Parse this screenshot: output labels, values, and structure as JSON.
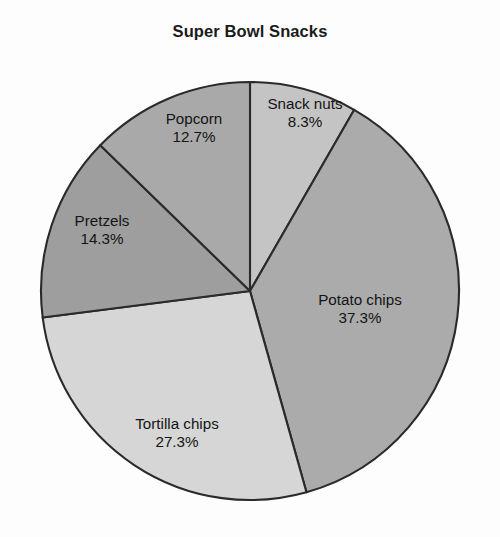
{
  "chart_data": {
    "type": "pie",
    "title": "Super Bowl Snacks",
    "xlabel": "",
    "ylabel": "",
    "legend": "none",
    "grid": false,
    "value_unit": "%",
    "start_angle_deg": 0,
    "direction": "clockwise",
    "categories": [
      "Snack nuts",
      "Potato chips",
      "Tortilla chips",
      "Pretzels",
      "Popcorn"
    ],
    "values": [
      8.3,
      37.3,
      27.3,
      14.3,
      12.7
    ],
    "labels": [
      "8.3%",
      "37.3%",
      "27.3%",
      "14.3%",
      "12.7%"
    ],
    "colors": [
      "#c4c4c4",
      "#ababab",
      "#d6d6d6",
      "#9e9e9e",
      "#a9a9a9"
    ],
    "slices": [
      {
        "name": "Snack nuts",
        "value": 8.3,
        "label": "8.3%",
        "color": "#c4c4c4",
        "label_x": 305,
        "label_y": 113
      },
      {
        "name": "Potato chips",
        "value": 37.3,
        "label": "37.3%",
        "color": "#ababab",
        "label_x": 360,
        "label_y": 309
      },
      {
        "name": "Tortilla chips",
        "value": 27.3,
        "label": "27.3%",
        "color": "#d6d6d6",
        "label_x": 177,
        "label_y": 433
      },
      {
        "name": "Pretzels",
        "value": 14.3,
        "label": "14.3%",
        "color": "#9e9e9e",
        "label_x": 102,
        "label_y": 230
      },
      {
        "name": "Popcorn",
        "value": 12.7,
        "label": "12.7%",
        "color": "#a9a9a9",
        "label_x": 194,
        "label_y": 128
      }
    ],
    "outline_color": "#2a2a2a",
    "background_color": "#fdfdfd"
  }
}
